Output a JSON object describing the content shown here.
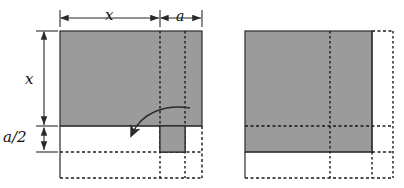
{
  "figure": {
    "type": "geometry-diagram",
    "colors": {
      "fill_gray": "#9b9b9b",
      "stroke_solid": "#2b2b2b",
      "stroke_dashed": "#1a1a1a",
      "background": "#ffffff"
    }
  },
  "labels": {
    "top_x": "x",
    "top_a": "a",
    "left_x": "x",
    "left_a_half": "a/2"
  },
  "left_panel": {
    "name": "left-figure",
    "solid_rect": {
      "x": 60,
      "y": 31,
      "w": 142,
      "h": 95
    },
    "tab_rect": {
      "x": 160,
      "y": 126,
      "w": 25,
      "h": 26
    },
    "dashed_vertical_1_x": 160,
    "dashed_vertical_2_x": 185,
    "dashed_horizontal_y": 152,
    "dashed_bottom_y": 178,
    "baseline_y": 126,
    "arrow": {
      "name": "fold-arrow",
      "start_x": 190,
      "start_y": 108,
      "end_x": 131,
      "end_y": 148
    }
  },
  "right_panel": {
    "name": "right-figure",
    "solid_rect": {
      "x": 245,
      "y": 31,
      "w": 127,
      "h": 121
    },
    "dashed_vertical_1_x": 330,
    "dashed_vertical_2_x": 372,
    "dashed_outer_x": 393,
    "dashed_horizontal_y": 126,
    "dashed_bottom_y": 178,
    "left_edge_x": 245
  },
  "dimensions": {
    "top_line_y": 18,
    "top_left_x": 60,
    "top_mid_x": 160,
    "top_right_x": 202,
    "left_line_x": 44,
    "left_top_y": 31,
    "left_mid_y": 126,
    "left_bottom_y": 152
  }
}
